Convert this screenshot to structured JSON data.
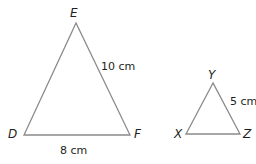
{
  "figure": {
    "triangles": [
      {
        "name": "DEF",
        "vertices": {
          "D": "D",
          "E": "E",
          "F": "F"
        },
        "measurements": {
          "EF": "10 cm",
          "DF": "8 cm"
        }
      },
      {
        "name": "XYZ",
        "vertices": {
          "X": "X",
          "Y": "Y",
          "Z": "Z"
        },
        "measurements": {
          "YZ": "5 cm"
        }
      }
    ],
    "stroke_color": "#8a8a8a",
    "text_color": "#231f20"
  }
}
